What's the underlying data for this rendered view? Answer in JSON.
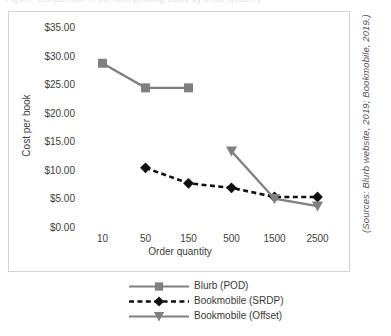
{
  "caption_sliver": "Figure: comparison of per-unit printing costs by order quantity",
  "source_note": "(Sources: Blurb website, 2019; Bookmobile, 2019.)",
  "colors": {
    "blurb": "#808080",
    "srdp": "#111111",
    "offset": "#808080",
    "frame": "#d3d3d3",
    "text": "#404040"
  },
  "legend": {
    "position": "bottom",
    "items": [
      {
        "label": "Blurb (POD)",
        "marker": "square",
        "line": "solid",
        "color": "#808080"
      },
      {
        "label": "Bookmobile (SRDP)",
        "marker": "diamond",
        "line": "dotted",
        "color": "#111111"
      },
      {
        "label": "Bookmobile (Offset)",
        "marker": "triangle-down",
        "line": "solid",
        "color": "#808080"
      }
    ]
  },
  "chart_data": {
    "type": "line",
    "title": "",
    "xlabel": "Order quantity",
    "ylabel": "Cost per book",
    "categories": [
      "10",
      "50",
      "150",
      "500",
      "1500",
      "2500"
    ],
    "ylim": [
      0,
      35
    ],
    "ytick_step": 5,
    "ytick_labels": [
      "$0.00",
      "$5.00",
      "$10.00",
      "$15.00",
      "$20.00",
      "$25.00",
      "$30.00",
      "$35.00"
    ],
    "ytick_values": [
      0,
      5,
      10,
      15,
      20,
      25,
      30,
      35
    ],
    "grid": false,
    "series": [
      {
        "name": "Blurb (POD)",
        "marker": "square",
        "line": "solid",
        "color": "#808080",
        "values": [
          29.0,
          24.7,
          24.7,
          null,
          null,
          null
        ]
      },
      {
        "name": "Bookmobile (SRDP)",
        "marker": "diamond",
        "line": "dotted",
        "color": "#111111",
        "values": [
          null,
          10.7,
          8.0,
          7.2,
          5.6,
          5.6
        ]
      },
      {
        "name": "Bookmobile (Offset)",
        "marker": "triangle-down",
        "line": "solid",
        "color": "#808080",
        "values": [
          null,
          null,
          null,
          13.6,
          5.3,
          4.0
        ]
      }
    ]
  }
}
